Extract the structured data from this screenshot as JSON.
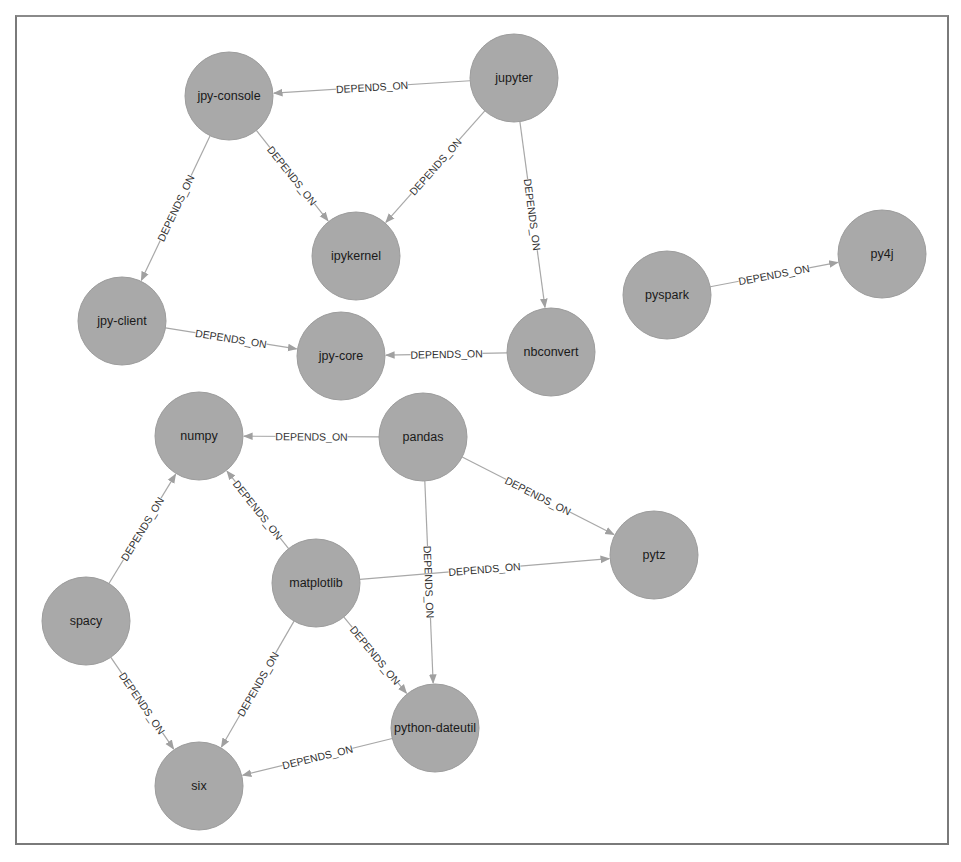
{
  "graph": {
    "node_radius": 44,
    "colors": {
      "node_fill": "#a9a9a9",
      "edge": "#a8a8a8",
      "label": "#1a1a1a",
      "frame": "#7a7a7a"
    },
    "nodes": [
      {
        "id": "jpy-console",
        "label": "jpy-console",
        "x": 229,
        "y": 96
      },
      {
        "id": "jupyter",
        "label": "jupyter",
        "x": 514,
        "y": 78
      },
      {
        "id": "ipykernel",
        "label": "ipykernel",
        "x": 356,
        "y": 256
      },
      {
        "id": "jpy-client",
        "label": "jpy-client",
        "x": 122,
        "y": 321
      },
      {
        "id": "jpy-core",
        "label": "jpy-core",
        "x": 341,
        "y": 356
      },
      {
        "id": "nbconvert",
        "label": "nbconvert",
        "x": 551,
        "y": 352
      },
      {
        "id": "pyspark",
        "label": "pyspark",
        "x": 667,
        "y": 295
      },
      {
        "id": "py4j",
        "label": "py4j",
        "x": 882,
        "y": 254
      },
      {
        "id": "numpy",
        "label": "numpy",
        "x": 199,
        "y": 436
      },
      {
        "id": "pandas",
        "label": "pandas",
        "x": 423,
        "y": 437
      },
      {
        "id": "pytz",
        "label": "pytz",
        "x": 654,
        "y": 555
      },
      {
        "id": "matplotlib",
        "label": "matplotlib",
        "x": 316,
        "y": 583
      },
      {
        "id": "spacy",
        "label": "spacy",
        "x": 86,
        "y": 621
      },
      {
        "id": "python-dateutil",
        "label": "python-dateutil",
        "x": 435,
        "y": 728
      },
      {
        "id": "six",
        "label": "six",
        "x": 199,
        "y": 786
      }
    ],
    "edges": [
      {
        "from": "jupyter",
        "to": "jpy-console",
        "label": "DEPENDS_ON"
      },
      {
        "from": "jupyter",
        "to": "ipykernel",
        "label": "DEPENDS_ON"
      },
      {
        "from": "jupyter",
        "to": "nbconvert",
        "label": "DEPENDS_ON"
      },
      {
        "from": "jpy-console",
        "to": "ipykernel",
        "label": "DEPENDS_ON"
      },
      {
        "from": "jpy-console",
        "to": "jpy-client",
        "label": "DEPENDS_ON"
      },
      {
        "from": "jpy-client",
        "to": "jpy-core",
        "label": "DEPENDS_ON"
      },
      {
        "from": "nbconvert",
        "to": "jpy-core",
        "label": "DEPENDS_ON"
      },
      {
        "from": "pyspark",
        "to": "py4j",
        "label": "DEPENDS_ON"
      },
      {
        "from": "pandas",
        "to": "numpy",
        "label": "DEPENDS_ON"
      },
      {
        "from": "pandas",
        "to": "pytz",
        "label": "DEPENDS_ON"
      },
      {
        "from": "pandas",
        "to": "python-dateutil",
        "label": "DEPENDS_ON"
      },
      {
        "from": "matplotlib",
        "to": "numpy",
        "label": "DEPENDS_ON"
      },
      {
        "from": "matplotlib",
        "to": "pytz",
        "label": "DEPENDS_ON"
      },
      {
        "from": "matplotlib",
        "to": "python-dateutil",
        "label": "DEPENDS_ON"
      },
      {
        "from": "matplotlib",
        "to": "six",
        "label": "DEPENDS_ON"
      },
      {
        "from": "spacy",
        "to": "numpy",
        "label": "DEPENDS_ON"
      },
      {
        "from": "spacy",
        "to": "six",
        "label": "DEPENDS_ON"
      },
      {
        "from": "python-dateutil",
        "to": "six",
        "label": "DEPENDS_ON"
      }
    ]
  }
}
